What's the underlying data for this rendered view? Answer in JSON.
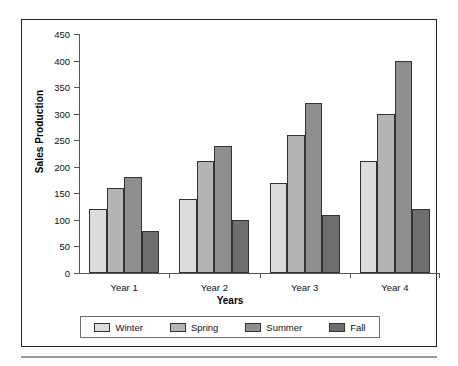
{
  "chart_data": {
    "type": "bar",
    "title": "",
    "xlabel": "Years",
    "ylabel": "Sales Production",
    "categories": [
      "Year 1",
      "Year 2",
      "Year 3",
      "Year 4"
    ],
    "series": [
      {
        "name": "Winter",
        "color": "#dcdcdc",
        "values": [
          120,
          140,
          170,
          210
        ]
      },
      {
        "name": "Spring",
        "color": "#b4b4b4",
        "values": [
          160,
          210,
          260,
          300
        ]
      },
      {
        "name": "Summer",
        "color": "#8e8e8e",
        "values": [
          180,
          240,
          320,
          400
        ]
      },
      {
        "name": "Fall",
        "color": "#6e6e6e",
        "values": [
          80,
          100,
          110,
          120
        ]
      }
    ],
    "ylim": [
      0,
      450
    ],
    "ytick_step": 50,
    "yticks": [
      0,
      50,
      100,
      150,
      200,
      250,
      300,
      350,
      400,
      450
    ],
    "ytick_labels": [
      "0",
      "50",
      "100",
      "150",
      "200",
      "250",
      "300",
      "350",
      "400",
      "450"
    ],
    "grid": false,
    "legend_position": "bottom",
    "legend_entries": [
      "Winter",
      "Spring",
      "Summer",
      "Fall"
    ],
    "axis_color": "#555555",
    "bar_border_color": "#333333",
    "frame_color": "#222222",
    "background": "#ffffff"
  }
}
